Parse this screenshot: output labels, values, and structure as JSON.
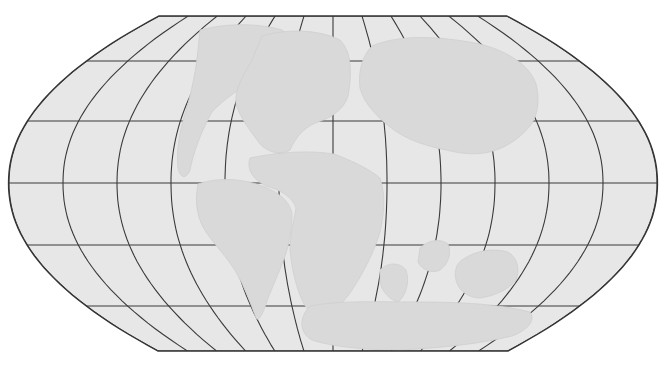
{
  "map": {
    "projection": "robinson",
    "colors": {
      "background": "#ffffff",
      "ocean": "#e7e7e7",
      "land": "#d9d9d9",
      "land_edge": "#cfcfcf",
      "grid": "#3a3a3a",
      "outline": "#333333"
    },
    "frame": {
      "center_x": 333,
      "equator_y": 183,
      "left_x": 9,
      "right_x": 658,
      "top_y": 16,
      "bottom_y": 351,
      "top_flat_x": [
        160,
        508
      ],
      "bottom_flat_x": [
        158,
        508
      ]
    },
    "graticule": {
      "meridian_spacing_deg": 30,
      "parallel_spacing_deg": 30,
      "meridian_x_at_equator": [
        9,
        63,
        117,
        171,
        225,
        279,
        333,
        387,
        441,
        495,
        549,
        603,
        657
      ],
      "parallel_y": [
        16,
        61,
        121,
        183,
        245,
        306,
        351
      ]
    },
    "landmasses": [
      {
        "name": "laurentia-north-america",
        "path": "M 200 30 C 230 22 262 24 282 30 L 300 44 C 290 60 276 72 258 80 C 240 88 225 98 212 112 C 202 130 194 150 190 170 C 186 180 180 178 178 168 C 176 150 180 130 186 110 C 192 90 196 70 198 50 Z"
      },
      {
        "name": "baltica-europe",
        "path": "M 262 36 C 290 28 320 30 340 40 C 352 52 352 74 348 96 C 344 110 330 118 318 122 C 306 126 296 136 290 150 C 280 156 268 152 260 144 C 250 130 240 118 236 104 C 234 90 244 74 252 60 Z"
      },
      {
        "name": "siberia-asia",
        "path": "M 372 46 C 400 34 440 36 480 44 C 510 52 530 66 536 84 C 540 100 538 116 530 126 C 520 138 508 146 496 150 C 480 156 462 154 446 150 C 426 146 408 140 394 130 C 378 118 364 104 360 88 C 358 72 362 56 372 46 Z"
      },
      {
        "name": "africa",
        "path": "M 250 158 C 278 152 310 150 334 154 C 350 160 368 168 380 178 C 386 196 384 214 380 232 C 374 252 364 272 352 290 C 344 302 334 312 326 318 C 318 320 310 314 304 304 C 296 288 292 270 290 250 C 290 236 294 220 296 208 C 292 196 280 190 266 186 C 254 180 246 170 250 158 Z"
      },
      {
        "name": "south-america",
        "path": "M 198 184 C 214 178 238 178 256 184 C 276 190 290 200 292 214 C 292 232 288 250 282 264 C 276 280 270 292 266 304 C 262 316 258 322 256 318 C 250 302 244 286 236 272 C 226 256 214 244 206 232 C 198 220 194 204 198 184 Z"
      },
      {
        "name": "madagascar-india",
        "path": "M 420 248 C 428 240 440 238 448 244 C 452 254 448 264 440 270 C 432 274 422 270 418 262 Z"
      },
      {
        "name": "australia",
        "path": "M 462 260 C 476 250 494 248 508 252 C 518 258 520 270 516 280 C 508 290 494 296 480 298 C 468 298 458 290 456 280 C 454 272 456 264 462 260 Z"
      },
      {
        "name": "antarctica",
        "path": "M 310 306 C 340 300 380 302 420 302 C 460 302 500 304 530 312 C 536 320 528 330 512 336 C 480 344 440 348 400 350 C 360 350 330 346 312 340 C 300 334 298 318 310 306 Z"
      },
      {
        "name": "east-gondwana-sliver",
        "path": "M 380 270 C 388 262 400 262 406 270 C 410 282 406 296 398 302 C 390 300 382 292 380 282 Z"
      }
    ]
  }
}
